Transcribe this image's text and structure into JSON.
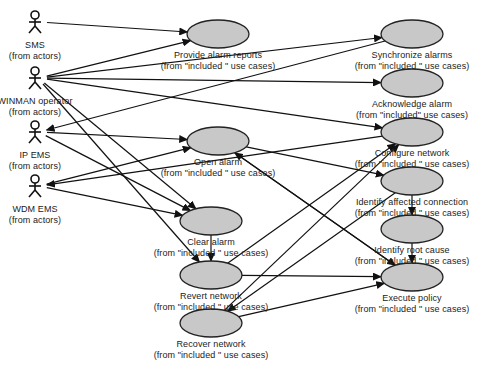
{
  "diagram": {
    "actors": [
      {
        "id": "sms",
        "name": "SMS",
        "package": "(from actors)",
        "x": 35,
        "y": 22
      },
      {
        "id": "winman",
        "name": "WINMAN operator",
        "package": "(from actors)",
        "x": 35,
        "y": 78
      },
      {
        "id": "ipems",
        "name": "IP EMS",
        "package": "(from actors)",
        "x": 35,
        "y": 132
      },
      {
        "id": "wdmems",
        "name": "WDM EMS",
        "package": "(from actors)",
        "x": 35,
        "y": 186
      }
    ],
    "use_cases": [
      {
        "id": "provide",
        "name": "Provide  alarm  reports",
        "package": "(from \"included \" use cases)",
        "cx": 218,
        "cy": 34
      },
      {
        "id": "sync",
        "name": "Synchronize  alarms",
        "package": "(from  \"included \" use cases)",
        "cx": 412,
        "cy": 34
      },
      {
        "id": "ack",
        "name": "Acknowledge  alarm",
        "package": "(from  \"included\" use cases)",
        "cx": 412,
        "cy": 83
      },
      {
        "id": "open",
        "name": "Open  alarm",
        "package": "(from  \"included \" use cases)",
        "cx": 218,
        "cy": 141
      },
      {
        "id": "configure",
        "name": "Configure  network",
        "package": "(from  \"included \" use cases)",
        "cx": 412,
        "cy": 132
      },
      {
        "id": "identify_conn",
        "name": "Identify  affected  connection",
        "package": "(from  \"included \" use cases)",
        "cx": 412,
        "cy": 181
      },
      {
        "id": "clear",
        "name": "Clear  alarm",
        "package": "(from \"included \" use cases)",
        "cx": 211,
        "cy": 221
      },
      {
        "id": "root_cause",
        "name": "Identify  root  cause",
        "package": "(from \"included \" use cases)",
        "cx": 412,
        "cy": 229
      },
      {
        "id": "revert",
        "name": "Revert  network",
        "package": "(from  \"included \" use cases)",
        "cx": 211,
        "cy": 275
      },
      {
        "id": "execute",
        "name": "Execute  policy",
        "package": "(from  \"included \" use cases)",
        "cx": 412,
        "cy": 277
      },
      {
        "id": "recover",
        "name": "Recover  network",
        "package": "(from  \"included \" use cases)",
        "cx": 211,
        "cy": 323
      }
    ],
    "associations": [
      {
        "from": "sms",
        "to": "provide"
      },
      {
        "from": "winman",
        "to": "provide"
      },
      {
        "from": "winman",
        "to": "sync"
      },
      {
        "from": "winman",
        "to": "ack"
      },
      {
        "from": "winman",
        "to": "configure"
      },
      {
        "from": "winman",
        "to": "clear"
      },
      {
        "from": "winman",
        "to": "revert"
      },
      {
        "from": "sync",
        "to": "ipems"
      },
      {
        "from": "ipems",
        "to": "open"
      },
      {
        "from": "ipems",
        "to": "clear"
      },
      {
        "from": "configure",
        "to": "wdmems"
      },
      {
        "from": "wdmems",
        "to": "open"
      },
      {
        "from": "wdmems",
        "to": "clear"
      },
      {
        "from": "open",
        "to": "identify_conn"
      },
      {
        "from": "execute",
        "to": "open"
      },
      {
        "from": "open",
        "to": "execute"
      },
      {
        "from": "identify_conn",
        "to": "root_cause"
      },
      {
        "from": "root_cause",
        "to": "execute"
      },
      {
        "from": "clear",
        "to": "revert"
      },
      {
        "from": "revert",
        "to": "configure"
      },
      {
        "from": "revert",
        "to": "execute"
      },
      {
        "from": "identify_conn",
        "to": "recover"
      },
      {
        "from": "recover",
        "to": "configure"
      },
      {
        "from": "recover",
        "to": "execute"
      }
    ]
  }
}
